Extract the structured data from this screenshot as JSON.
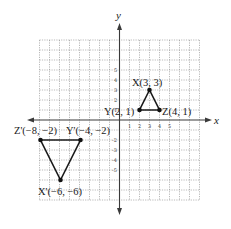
{
  "diagram": {
    "type": "coordinate-plane",
    "axes": {
      "x_label": "x",
      "y_label": "y",
      "x_range": [
        -8,
        8
      ],
      "y_range": [
        -8,
        8
      ],
      "x_tick_labels": [
        "1",
        "2",
        "3",
        "4",
        "5"
      ],
      "y_tick_labels_positive": [
        "1",
        "2",
        "3",
        "4",
        "5"
      ],
      "y_tick_labels_negative": [
        "-2",
        "-3",
        "-4",
        "-5"
      ]
    },
    "triangles": [
      {
        "name": "XYZ",
        "vertices": [
          {
            "id": "X",
            "x": 3,
            "y": 3,
            "label": "X(3, 3)"
          },
          {
            "id": "Y",
            "x": 2,
            "y": 1,
            "label": "Y(2, 1)"
          },
          {
            "id": "Z",
            "x": 4,
            "y": 1,
            "label": "Z(4, 1)"
          }
        ]
      },
      {
        "name": "X'Y'Z'",
        "vertices": [
          {
            "id": "X'",
            "x": -6,
            "y": -6,
            "label": "X'(−6, −6)"
          },
          {
            "id": "Y'",
            "x": -4,
            "y": -2,
            "label": "Y'(−4, −2)"
          },
          {
            "id": "Z'",
            "x": -8,
            "y": -2,
            "label": "Z'(−8, −2)"
          }
        ]
      }
    ],
    "colors": {
      "grid": "#8a8a8a",
      "axis": "#3a3a3a",
      "edge": "#1a1a1a"
    }
  }
}
